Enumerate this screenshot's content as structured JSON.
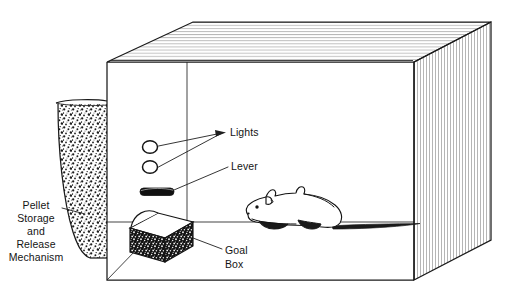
{
  "figure": {
    "background_color": "#ffffff",
    "ink_color": "#1a1a1a"
  },
  "labels": {
    "lights": "Lights",
    "lever": "Lever",
    "goal_box_line1": "Goal",
    "goal_box_line2": "Box",
    "pellet_line1": "Pellet",
    "pellet_line2": "Storage",
    "pellet_line3": "and",
    "pellet_line4": "Release",
    "pellet_line5": "Mechanism"
  },
  "parts": [
    {
      "name": "chamber",
      "label": ""
    },
    {
      "name": "light-upper",
      "label": "Lights"
    },
    {
      "name": "light-lower",
      "label": "Lights"
    },
    {
      "name": "lever",
      "label": "Lever"
    },
    {
      "name": "goal-box",
      "label": "Goal Box"
    },
    {
      "name": "pellet-hopper",
      "label": "Pellet Storage and Release Mechanism"
    },
    {
      "name": "rat",
      "label": ""
    }
  ]
}
